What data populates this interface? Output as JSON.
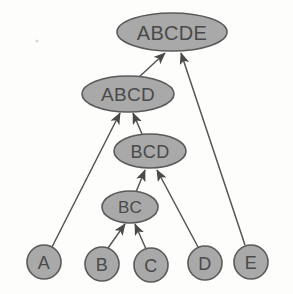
{
  "diagram": {
    "type": "directed-acyclic-graph",
    "background_color": "#fdfdfb",
    "node_fill_color": "#a9a9a9",
    "node_stroke_color": "#5a5a5a",
    "edge_color": "#555555",
    "label_color": "#4a4a4a",
    "nodes": [
      {
        "id": "ABCDE",
        "label": "ABCDE",
        "shape": "ellipse",
        "cx": 172,
        "cy": 32,
        "rx": 55,
        "ry": 19,
        "font_size": 20,
        "level": 0
      },
      {
        "id": "ABCD",
        "label": "ABCD",
        "shape": "ellipse",
        "cx": 128,
        "cy": 94,
        "rx": 46,
        "ry": 18,
        "font_size": 19,
        "level": 1
      },
      {
        "id": "BCD",
        "label": "BCD",
        "shape": "ellipse",
        "cx": 150,
        "cy": 151,
        "rx": 36,
        "ry": 17,
        "font_size": 18,
        "level": 2
      },
      {
        "id": "BC",
        "label": "BC",
        "shape": "ellipse",
        "cx": 130,
        "cy": 207,
        "rx": 28,
        "ry": 16,
        "font_size": 17,
        "level": 3
      },
      {
        "id": "A",
        "label": "A",
        "shape": "circle",
        "cx": 44,
        "cy": 262,
        "rx": 17,
        "ry": 17,
        "font_size": 18,
        "level": 4
      },
      {
        "id": "B",
        "label": "B",
        "shape": "circle",
        "cx": 102,
        "cy": 264,
        "rx": 17,
        "ry": 17,
        "font_size": 18,
        "level": 4
      },
      {
        "id": "C",
        "label": "C",
        "shape": "circle",
        "cx": 151,
        "cy": 265,
        "rx": 17,
        "ry": 17,
        "font_size": 18,
        "level": 4
      },
      {
        "id": "D",
        "label": "D",
        "shape": "circle",
        "cx": 205,
        "cy": 263,
        "rx": 17,
        "ry": 17,
        "font_size": 18,
        "level": 4
      },
      {
        "id": "E",
        "label": "E",
        "shape": "circle",
        "cx": 251,
        "cy": 262,
        "rx": 17,
        "ry": 17,
        "font_size": 18,
        "level": 4
      }
    ],
    "edges": [
      {
        "from": "ABCD",
        "to": "ABCDE",
        "x1": 138,
        "y1": 78,
        "x2": 165,
        "y2": 53,
        "arrow": true
      },
      {
        "from": "E",
        "to": "ABCDE",
        "x1": 245,
        "y1": 245,
        "x2": 181,
        "y2": 53,
        "arrow": true
      },
      {
        "from": "A",
        "to": "ABCD",
        "x1": 52,
        "y1": 247,
        "x2": 120,
        "y2": 113,
        "arrow": true
      },
      {
        "from": "BCD",
        "to": "ABCD",
        "x1": 142,
        "y1": 134,
        "x2": 133,
        "y2": 113,
        "arrow": true
      },
      {
        "from": "BC",
        "to": "BCD",
        "x1": 136,
        "y1": 192,
        "x2": 145,
        "y2": 170,
        "arrow": true
      },
      {
        "from": "D",
        "to": "BCD",
        "x1": 198,
        "y1": 247,
        "x2": 157,
        "y2": 170,
        "arrow": true
      },
      {
        "from": "B",
        "to": "BC",
        "x1": 108,
        "y1": 248,
        "x2": 125,
        "y2": 224,
        "arrow": true
      },
      {
        "from": "C",
        "to": "BC",
        "x1": 146,
        "y1": 249,
        "x2": 135,
        "y2": 224,
        "arrow": true
      }
    ]
  }
}
